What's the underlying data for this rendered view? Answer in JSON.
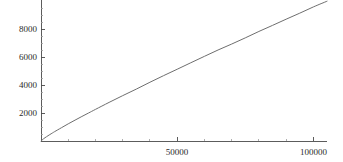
{
  "chart_data": {
    "type": "line",
    "title": "",
    "subtitle": "",
    "xlabel": "",
    "ylabel": "",
    "xlim": [
      0,
      105000
    ],
    "ylim": [
      0,
      9800
    ],
    "grid": false,
    "legend": null,
    "background_color": "#ffffff",
    "line_color": "#6e6e6e",
    "axis_color": "#4a4a4a",
    "x_ticks": [
      {
        "value": 50000,
        "label": "50000"
      },
      {
        "value": 100000,
        "label": "100000"
      }
    ],
    "y_ticks": [
      {
        "value": 2000,
        "label": "2000"
      },
      {
        "value": 4000,
        "label": "4000"
      },
      {
        "value": 6000,
        "label": "6000"
      },
      {
        "value": 8000,
        "label": "8000"
      }
    ],
    "x_minor_tick_step": 10000,
    "y_minor_tick_step": 500,
    "series": [
      {
        "name": "pi(n)",
        "x": [
          0,
          1000,
          2000,
          3000,
          4000,
          5000,
          7500,
          10000,
          12500,
          15000,
          17500,
          20000,
          25000,
          30000,
          35000,
          40000,
          45000,
          50000,
          55000,
          60000,
          65000,
          70000,
          75000,
          80000,
          85000,
          90000,
          95000,
          100000,
          105000
        ],
        "y": [
          0,
          168,
          303,
          430,
          550,
          669,
          950,
          1229,
          1492,
          1754,
          2007,
          2262,
          2762,
          3245,
          3713,
          4203,
          4675,
          5133,
          5597,
          6057,
          6510,
          6935,
          7378,
          7837,
          8270,
          8713,
          9145,
          9592,
          9999
        ]
      }
    ]
  },
  "axes": {
    "y_axis_name": "vertical-axis",
    "x_axis_name": "horizontal-axis"
  }
}
